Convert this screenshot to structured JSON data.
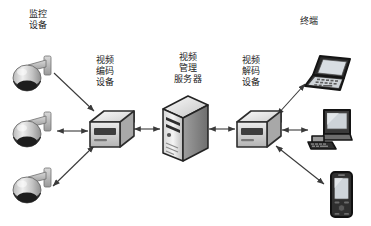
{
  "diagram": {
    "background_color": "#ffffff",
    "line_color": "#3a3a3a",
    "labels": {
      "monitoring_device": "监控\n设备",
      "video_encoder": "视频\n编码\n设备",
      "video_management_server": "视频\n管理\n服务器",
      "video_decoder": "视频\n解码\n设备",
      "terminal": "终端"
    },
    "nodes": [
      {
        "id": "camera-1",
        "type": "dome-camera",
        "group": "monitoring_device"
      },
      {
        "id": "camera-2",
        "type": "dome-camera",
        "group": "monitoring_device"
      },
      {
        "id": "camera-3",
        "type": "dome-camera",
        "group": "monitoring_device"
      },
      {
        "id": "encoder",
        "type": "network-box",
        "group": "video_encoder"
      },
      {
        "id": "server",
        "type": "tower-server",
        "group": "video_management_server"
      },
      {
        "id": "decoder",
        "type": "network-box",
        "group": "video_decoder"
      },
      {
        "id": "laptop",
        "type": "laptop",
        "group": "terminal"
      },
      {
        "id": "desktop",
        "type": "desktop-pc",
        "group": "terminal"
      },
      {
        "id": "phone",
        "type": "mobile-phone",
        "group": "terminal"
      }
    ],
    "connections": [
      {
        "from": "camera-1",
        "to": "encoder",
        "direction": "single"
      },
      {
        "from": "camera-2",
        "to": "encoder",
        "direction": "double"
      },
      {
        "from": "camera-3",
        "to": "encoder",
        "direction": "double"
      },
      {
        "from": "encoder",
        "to": "server",
        "direction": "double"
      },
      {
        "from": "server",
        "to": "decoder",
        "direction": "double"
      },
      {
        "from": "decoder",
        "to": "laptop",
        "direction": "double"
      },
      {
        "from": "decoder",
        "to": "desktop",
        "direction": "double"
      },
      {
        "from": "decoder",
        "to": "phone",
        "direction": "double"
      }
    ]
  }
}
